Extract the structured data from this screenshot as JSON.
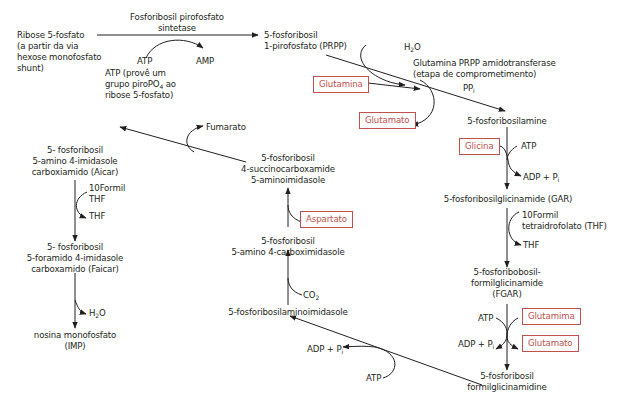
{
  "diagram": {
    "accent_color": "#c0504d",
    "text_color": "#231f20",
    "nodes": {
      "ribose": [
        "Ribose 5-fosfato",
        "(a partir da via",
        "hexose monofosfato",
        "shunt)"
      ],
      "prpp": [
        "5-fosforibosil",
        "1-pirofosfato (PRPP)"
      ],
      "phosphoribosylamine": "5-fosforibosilamine",
      "gar": "5-fosforibosilglicinamide (GAR)",
      "fgar": [
        "5-fosforibobosil-",
        "formilglicinamide",
        "(FGAR)"
      ],
      "fgam": [
        "5-fosforibosil",
        "formilglicinamidine"
      ],
      "air": "5-fosforibosilaminoimidasole",
      "cair": [
        "5-fosforibosil",
        "5-amino 4-carboximidasole"
      ],
      "saicar": [
        "5-fosforibosil",
        "4-succinocarboxamide",
        "5-aminoimidasole"
      ],
      "aicar": [
        "5- fosforibosil",
        "5-amino 4-imidasole",
        "carboxiamido (Aicar)"
      ],
      "faicar": [
        "5- fosforibosil",
        "5-foramido 4-imidasole",
        "carboxamido (Faicar)"
      ],
      "imp": [
        "nosina monofosfato",
        "(IMP)"
      ]
    },
    "enzymes": {
      "prpp_synthetase": [
        "Fosforibosil pirofosfato",
        "sintetase"
      ],
      "amidotransferase": [
        "Glutamina PRPP amidotransferase",
        "(etapa de comprometimento)"
      ]
    },
    "cofactors": {
      "atp1": "ATP",
      "amp": "AMP",
      "atp_note": [
        "ATP (provê um",
        "grupo piroPO",
        "4",
        " ao",
        "ribose 5-fosfato)"
      ],
      "h2o_1": [
        "H",
        "2",
        "O"
      ],
      "ppi": [
        "PP",
        "i"
      ],
      "atp_gar": "ATP",
      "adp_gar": [
        "ADP + P",
        "i"
      ],
      "formyl_thf": [
        "10Formil",
        "tetraidrofolato (THF)"
      ],
      "thf_out": "THF",
      "atp_fgam": "ATP",
      "adp_fgam": [
        "ADP + P",
        "i"
      ],
      "atp_air": "ATP",
      "adp_air": [
        "ADP + P",
        "i"
      ],
      "co2": [
        "CO",
        "2"
      ],
      "fumarato": "Fumarato",
      "formyl_thf2": [
        "10Formil",
        "THF"
      ],
      "thf_out2": "THF",
      "h2o_2": [
        "H",
        "2",
        "O"
      ]
    },
    "boxes": {
      "glutamina1": "Glutamina",
      "glutamato1": "Glutamato",
      "glicina": "Glicina",
      "glutamina2": "Glutamima",
      "glutamato2": "Glutamato",
      "aspartato": "Aspartato"
    }
  }
}
